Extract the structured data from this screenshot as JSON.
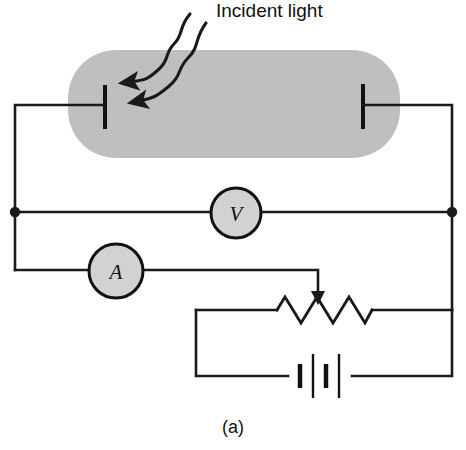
{
  "figure": {
    "caption": "(a)",
    "incident_light_label": "Incident light",
    "type": "photoconductive cell circuit schematic"
  },
  "colors": {
    "cell_fill": "#bfbfbf",
    "meter_fill": "#d2d2d2",
    "wire": "#1a1a1a",
    "background": "#ffffff",
    "text": "#111111"
  },
  "components": {
    "photocell": {
      "name": "photoconductive cell",
      "x": 68,
      "y": 50,
      "width": 332,
      "height": 108,
      "corner_radius": 48
    },
    "electrode_left": {
      "x": 105,
      "y_top": 85,
      "y_bottom": 129
    },
    "electrode_right": {
      "x": 363,
      "y_top": 84,
      "y_bottom": 129
    },
    "voltmeter": {
      "label": "V",
      "cx": 236,
      "cy": 213,
      "r": 25
    },
    "ammeter": {
      "label": "A",
      "cx": 116,
      "cy": 271,
      "r": 27
    },
    "rheostat": {
      "name": "variable resistor",
      "x_start": 277,
      "x_end": 372,
      "y": 310,
      "peaks": 6,
      "amplitude": 13,
      "wiper_x": 318,
      "wiper_y_top": 272
    },
    "battery": {
      "name": "battery",
      "y": 376,
      "cells": 2,
      "plates": [
        {
          "x": 300,
          "half_height": 12,
          "thickness": 4
        },
        {
          "x": 312,
          "half_height": 22,
          "thickness": 2
        },
        {
          "x": 326,
          "half_height": 12,
          "thickness": 4
        },
        {
          "x": 339,
          "half_height": 22,
          "thickness": 2
        }
      ],
      "left_terminal_x": 288,
      "right_terminal_x": 352
    },
    "junction_dots": [
      {
        "x": 15,
        "y": 212
      },
      {
        "x": 452,
        "y": 212
      }
    ],
    "light_arrows": [
      {
        "from_x": 190,
        "from_y": 14,
        "to_x": 119,
        "to_y": 86
      },
      {
        "from_x": 206,
        "from_y": 23,
        "to_x": 128,
        "to_y": 107
      }
    ]
  },
  "wires": {
    "cell_left_lead": "electrode-left to x=15 at y=105",
    "cell_right_lead": "electrode-right to x=452 at y=105",
    "left_rail_x": 15,
    "right_rail_x": 452,
    "voltmeter_branch_y": 212,
    "ammeter_branch_y": 270,
    "resistor_branch_y": 310,
    "battery_branch_y": 376,
    "battery_loop_left_x": 196
  }
}
